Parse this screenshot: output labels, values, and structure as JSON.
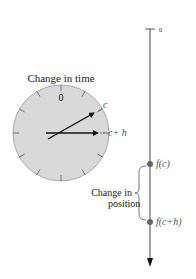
{
  "clock": {
    "title": "Change in time",
    "zero_label": "0",
    "hand_c_label": "c",
    "hand_ch_label": "c+ h",
    "face_color": "#d9d9d9"
  },
  "axis": {
    "zero_label": "0",
    "point_c_label": "f(c)",
    "point_ch_label": "f(c+h)",
    "brace_label_line1": "Change in",
    "brace_label_line2": "position",
    "dot_color": "#666666"
  }
}
